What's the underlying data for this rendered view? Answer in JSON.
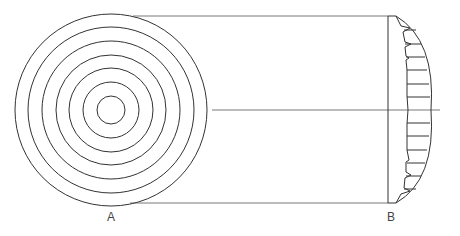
{
  "diagram": {
    "labels": {
      "a": "A",
      "b": "B"
    },
    "stroke_color": "#333333",
    "rings": [
      14,
      28,
      42,
      55,
      69,
      83,
      96
    ]
  }
}
